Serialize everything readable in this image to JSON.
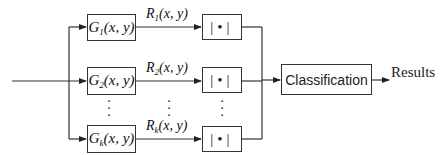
{
  "diagram": {
    "type": "block-diagram",
    "input": {
      "label": ""
    },
    "filters": [
      {
        "name": "G",
        "sub": "1",
        "args": "(x, y)"
      },
      {
        "name": "G",
        "sub": "2",
        "args": "(x, y)"
      },
      {
        "name": "G",
        "sub": "k",
        "args": "(x, y)"
      }
    ],
    "responses": [
      {
        "name": "R",
        "sub": "1",
        "args": "(x, y)"
      },
      {
        "name": "R",
        "sub": "2",
        "args": "(x, y)"
      },
      {
        "name": "R",
        "sub": "k",
        "args": "(x, y)"
      }
    ],
    "abs_blocks": [
      {
        "symbol": "|•|"
      },
      {
        "symbol": "|•|"
      },
      {
        "symbol": "|•|"
      }
    ],
    "ellipsis": "⋮",
    "classifier": {
      "label": "Classification"
    },
    "output": {
      "label": "Results"
    },
    "colors": {
      "line": "#333333",
      "text": "#111111",
      "background": "#ffffff"
    }
  }
}
